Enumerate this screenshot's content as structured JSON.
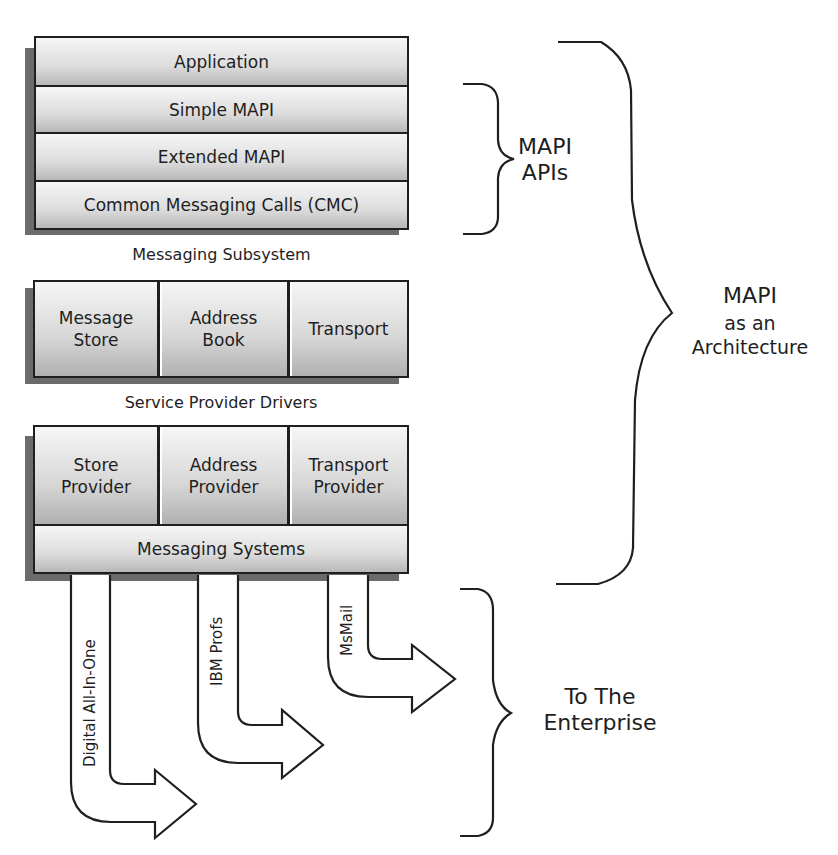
{
  "api_stack": {
    "layers": [
      "Application",
      "Simple MAPI",
      "Extended MAPI",
      "Common Messaging Calls (CMC)"
    ],
    "caption": "Messaging Subsystem"
  },
  "driver_stack": {
    "cells": [
      "Message\nStore",
      "Address\nBook",
      "Transport"
    ],
    "caption": "Service Provider Drivers"
  },
  "provider_stack": {
    "cells": [
      "Store\nProvider",
      "Address\nProvider",
      "Transport\nProvider"
    ],
    "base_label": "Messaging Systems"
  },
  "arrows": [
    {
      "label": "Digital All-In-One"
    },
    {
      "label": "IBM Profs"
    },
    {
      "label": "MsMail"
    }
  ],
  "braces": {
    "mapi_apis": "MAPI\nAPIs",
    "architecture_title": "MAPI",
    "architecture_sub": "as an\nArchitecture",
    "enterprise": "To The\nEnterprise"
  },
  "colors": {
    "outline": "#1f1f1f",
    "shadow": "#6b6b6b",
    "fill_light": "#f6f6f6",
    "fill_dark": "#b8b8b8"
  }
}
